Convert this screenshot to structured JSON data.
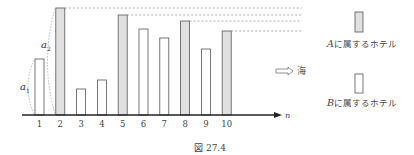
{
  "figure": {
    "caption": "図 27.4",
    "axis_label": "n",
    "sea_label": "海",
    "annotations": {
      "a1": "a",
      "a1_sub": "1",
      "a2": "a",
      "a2_sub": "2"
    }
  },
  "legend": {
    "A": {
      "var": "A",
      "text": "に属するホテル",
      "fill": "#e0e0e0"
    },
    "B": {
      "var": "B",
      "text": "に属するホテル",
      "fill": "#ffffff"
    }
  },
  "chart_data": {
    "type": "bar",
    "title": "図 27.4",
    "xlabel": "n",
    "ylabel": "",
    "categories": [
      "1",
      "2",
      "3",
      "4",
      "5",
      "6",
      "7",
      "8",
      "9",
      "10"
    ],
    "values": [
      56,
      107,
      26,
      35,
      100,
      86,
      77,
      94,
      66,
      84
    ],
    "groups": [
      "B",
      "A",
      "B",
      "B",
      "A",
      "B",
      "B",
      "A",
      "B",
      "A"
    ],
    "series": [
      {
        "name": "Aに属するホテル",
        "indices": [
          2,
          5,
          8,
          10
        ],
        "color": "#e0e0e0"
      },
      {
        "name": "Bに属するホテル",
        "indices": [
          1,
          3,
          4,
          6,
          7,
          9
        ],
        "color": "#ffffff"
      }
    ],
    "annotations": [
      "a1 (height of bar 1)",
      "a2 (height of bar 2)",
      "dashed lines from tops of A bars",
      "⇨ 海 (direction of sea)"
    ],
    "grid": false,
    "legend_position": "right"
  },
  "ticks": [
    "1",
    "2",
    "3",
    "4",
    "5",
    "6",
    "7",
    "8",
    "9",
    "10"
  ]
}
